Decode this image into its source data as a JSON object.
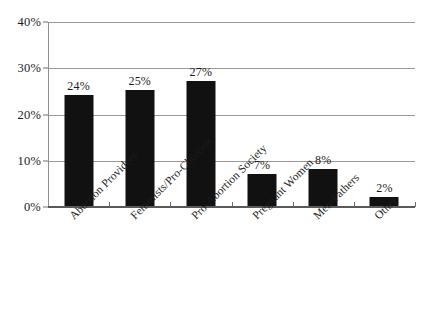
{
  "chart_data": {
    "type": "bar",
    "title": "",
    "xlabel": "",
    "ylabel": "",
    "categories": [
      "Abortion Providers",
      "Feminists/Pro-Choicers",
      "Pro-Abortion Society",
      "Pregnant Women",
      "Men/Fathers",
      "Other"
    ],
    "values": [
      24,
      25,
      27,
      7,
      8,
      2
    ],
    "value_labels": [
      "24%",
      "25%",
      "27%",
      "7%",
      "8%",
      "2%"
    ],
    "ylim": [
      0,
      40
    ],
    "ytick_values": [
      0,
      10,
      20,
      30,
      40
    ],
    "ytick_labels": [
      "0%",
      "10%",
      "20%",
      "30%",
      "40%"
    ],
    "grid": true,
    "legend": false,
    "bar_color": "#111111",
    "gridline_color": "#9a9a9a",
    "axis_color": "#5a5a5a",
    "background_color": "#ffffff"
  }
}
